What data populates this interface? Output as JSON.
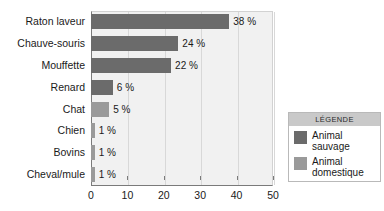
{
  "chart_data": {
    "type": "bar",
    "orientation": "horizontal",
    "title": "",
    "xlabel": "",
    "ylabel": "",
    "xlim": [
      0,
      50
    ],
    "xticks": [
      0,
      10,
      20,
      30,
      40,
      50
    ],
    "xtick_labels": [
      "0",
      "10",
      "20",
      "30",
      "40",
      "50"
    ],
    "grid": "vertical",
    "categories": [
      "Raton laveur",
      "Chauve-souris",
      "Mouffette",
      "Renard",
      "Chat",
      "Chien",
      "Bovins",
      "Cheval/mule"
    ],
    "values": [
      38,
      24,
      22,
      6,
      5,
      1,
      1,
      1
    ],
    "data_labels": [
      "38 %",
      "24 %",
      "22 %",
      "6 %",
      "5 %",
      "1 %",
      "1 %",
      "1 %"
    ],
    "groups": [
      "wild",
      "wild",
      "wild",
      "wild",
      "domestic",
      "domestic",
      "domestic",
      "domestic"
    ],
    "series": [
      {
        "name": "Animal sauvage",
        "color": "#6b6b6b",
        "points": [
          {
            "category": "Raton laveur",
            "value": 38,
            "label": "38 %"
          },
          {
            "category": "Chauve-souris",
            "value": 24,
            "label": "24 %"
          },
          {
            "category": "Mouffette",
            "value": 22,
            "label": "22 %"
          },
          {
            "category": "Renard",
            "value": 6,
            "label": "6 %"
          }
        ]
      },
      {
        "name": "Animal domestique",
        "color": "#9a9a9a",
        "points": [
          {
            "category": "Chat",
            "value": 5,
            "label": "5 %"
          },
          {
            "category": "Chien",
            "value": 1,
            "label": "1 %"
          },
          {
            "category": "Bovins",
            "value": 1,
            "label": "1 %"
          },
          {
            "category": "Cheval/mule",
            "value": 1,
            "label": "1 %"
          }
        ]
      }
    ],
    "legend": {
      "position": "right",
      "title": "LÉGENDE",
      "entries": [
        {
          "label_line1": "Animal",
          "label_line2": "sauvage",
          "color": "#6b6b6b",
          "group": "wild"
        },
        {
          "label_line1": "Animal",
          "label_line2": "domestique",
          "color": "#9a9a9a",
          "group": "domestic"
        }
      ]
    },
    "colors": {
      "wild": "#6b6b6b",
      "domestic": "#9a9a9a",
      "plot_background": "#f1f1f1",
      "axis": "#7a7a7a",
      "gridline": "#d8d8d8",
      "legend_title_background": "#c9c9c9",
      "legend_border": "#b9b9b9",
      "text": "#1a1a1a"
    }
  }
}
